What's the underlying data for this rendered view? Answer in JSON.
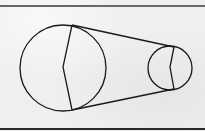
{
  "diagram": {
    "type": "belt-pulley",
    "colors": {
      "background": "#efefed",
      "stroke": "#1a1a1a",
      "frame": "#3a3a3a"
    },
    "frame": {
      "top_line_y": 6,
      "bottom_line_y": 129
    },
    "pulleys": [
      {
        "name": "large-pulley",
        "cx": 63,
        "cy": 68,
        "r": 43,
        "chord": [
          [
            72,
            25
          ],
          [
            63,
            67
          ],
          [
            72,
            110
          ]
        ]
      },
      {
        "name": "small-pulley",
        "cx": 170,
        "cy": 68,
        "r": 22,
        "chord": [
          [
            174,
            47
          ],
          [
            170,
            67
          ],
          [
            174,
            89
          ]
        ]
      }
    ],
    "belt": {
      "top": [
        [
          72,
          25
        ],
        [
          174,
          47
        ]
      ],
      "bottom": [
        [
          72,
          110
        ],
        [
          174,
          89
        ]
      ]
    }
  }
}
